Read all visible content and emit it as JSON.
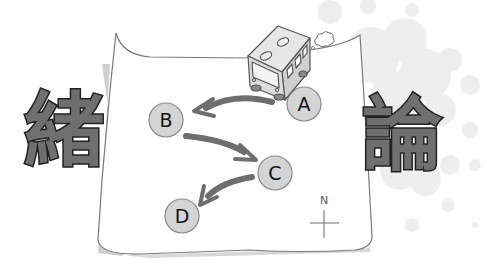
{
  "illustration": {
    "title_kanji_left": "緒",
    "title_kanji_right": "論",
    "route": {
      "nodes": [
        {
          "id": "A",
          "label": "A"
        },
        {
          "id": "B",
          "label": "B"
        },
        {
          "id": "C",
          "label": "C"
        },
        {
          "id": "D",
          "label": "D"
        }
      ],
      "edges": [
        {
          "from": "A",
          "to": "B"
        },
        {
          "from": "B",
          "to": "C"
        },
        {
          "from": "C",
          "to": "D"
        }
      ]
    },
    "compass_label": "N",
    "icons": [
      "bus-icon",
      "exhaust-puff-icon",
      "compass-icon",
      "map-sheet"
    ],
    "colors": {
      "node_fill": "#d4d4d4",
      "node_stroke": "#8a8a8a",
      "arrow": "#6e6e6e",
      "kanji_fill": "#6f6f6f",
      "kanji_outline": "#222222",
      "map_outline": "#7a7a7a",
      "map_shadow": "#cfcfcf",
      "bokeh": "#ececec"
    }
  }
}
